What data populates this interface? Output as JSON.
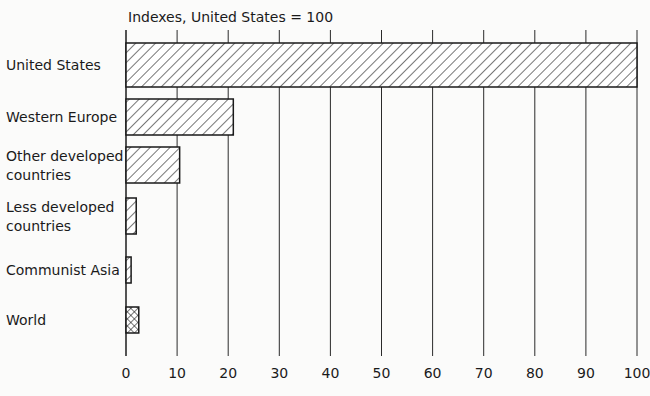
{
  "chart_data": {
    "type": "bar",
    "orientation": "horizontal",
    "title": "Indexes, United States = 100",
    "xlabel": "",
    "ylabel": "",
    "xlim": [
      0,
      100
    ],
    "xticks": [
      0,
      10,
      20,
      30,
      40,
      50,
      60,
      70,
      80,
      90,
      100
    ],
    "grid": true,
    "categories": [
      "United States",
      "Western Europe",
      "Other developed countries",
      "Less developed countries",
      "Communist Asia",
      "World"
    ],
    "category_lines": [
      [
        "United States"
      ],
      [
        "Western Europe"
      ],
      [
        "Other developed",
        "countries"
      ],
      [
        "Less developed",
        "countries"
      ],
      [
        "Communist Asia"
      ],
      [
        "World"
      ]
    ],
    "values": [
      100,
      21,
      10.5,
      2,
      1,
      2.5
    ],
    "patterns": [
      "diagonal",
      "diagonal",
      "diagonal",
      "diagonal",
      "diagonal",
      "crosshatch"
    ]
  }
}
